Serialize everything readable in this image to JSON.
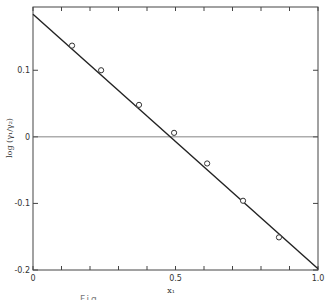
{
  "chart_data": {
    "type": "scatter",
    "title": "",
    "xlabel": "x₁",
    "ylabel": "log (γ₁/γ₂)",
    "xlim": [
      0,
      1.0
    ],
    "ylim": [
      -0.2,
      0.195
    ],
    "x_ticks": [
      0,
      0.1,
      0.2,
      0.3,
      0.4,
      0.5,
      0.6,
      0.7,
      0.8,
      0.9,
      1.0
    ],
    "x_tick_labels": [
      {
        "value": 0,
        "label": "0"
      },
      {
        "value": 0.5,
        "label": "0.5"
      },
      {
        "value": 1.0,
        "label": "1.0"
      }
    ],
    "y_ticks": [
      {
        "value": 0.1,
        "label": "0.1"
      },
      {
        "value": 0,
        "label": "0"
      },
      {
        "value": -0.1,
        "label": "-0.1"
      },
      {
        "value": -0.2,
        "label": "-0.2"
      }
    ],
    "grid": false,
    "reference_line": {
      "y": 0
    },
    "series": [
      {
        "name": "experimental points",
        "marker": "open-circle",
        "x": [
          0.137,
          0.239,
          0.372,
          0.495,
          0.611,
          0.737,
          0.863
        ],
        "y": [
          0.137,
          0.1,
          0.048,
          0.006,
          -0.04,
          -0.096,
          -0.151
        ]
      },
      {
        "name": "fitted line",
        "marker": "none",
        "x": [
          0.0,
          1.0
        ],
        "y": [
          0.184,
          -0.198
        ]
      }
    ],
    "legend": null
  },
  "caption": "Fig. ..."
}
